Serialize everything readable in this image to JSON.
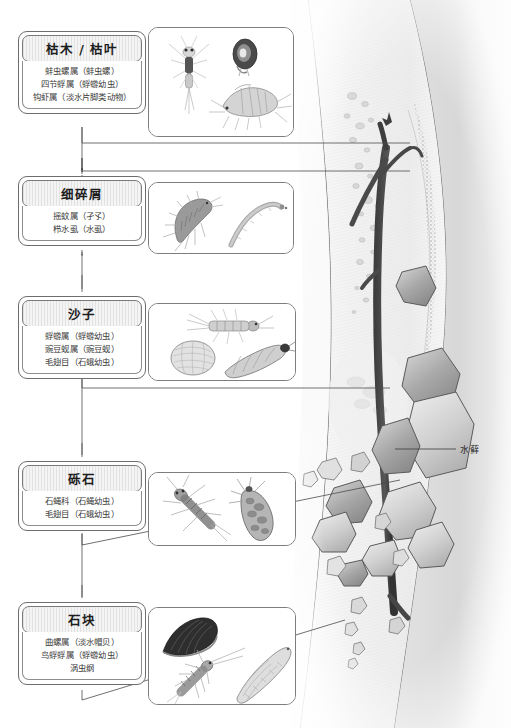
{
  "header": {
    "cropped_text": "有鳞片 底栖动物 — 河流底质分布 示意图"
  },
  "figure": {
    "stream_callout_label": "水藓"
  },
  "cards": [
    {
      "id": "deadwood",
      "title": "枯木 / 枯叶",
      "entries": [
        "蚌虫螺属（蚌虫螺）",
        "四节蜉属（蜉蝣幼虫）",
        "钩虾属（淡水片脚类动物）"
      ]
    },
    {
      "id": "fine-detritus",
      "title": "细碎屑",
      "entries": [
        "摇蚊属（孑孓）",
        "栉水虱（水虱）"
      ]
    },
    {
      "id": "sand",
      "title": "沙子",
      "entries": [
        "蜉蝣属（蜉蝣幼虫）",
        "豌豆蚬属（豌豆蚬）",
        "毛翅目（石蛾幼虫）"
      ]
    },
    {
      "id": "gravel",
      "title": "砾石",
      "entries": [
        "石蝇科（石蝇幼虫）",
        "毛翅目（石蛾幼虫）"
      ]
    },
    {
      "id": "boulder",
      "title": "石块",
      "entries": [
        "曲螺属（淡水帽贝）",
        "鸟蜉蜉属（蜉蝣幼虫）",
        "涡虫纲"
      ]
    }
  ],
  "panels": [
    {
      "id": "panel-deadwood",
      "specimens": [
        "mayfly-nymph-icon",
        "snail-icon",
        "amphipod-icon"
      ]
    },
    {
      "id": "panel-fine-detritus",
      "specimens": [
        "water-louse-icon",
        "midge-larva-icon"
      ]
    },
    {
      "id": "panel-sand",
      "specimens": [
        "mayfly-nymph-icon",
        "pea-clam-icon",
        "caddisfly-case-icon"
      ]
    },
    {
      "id": "panel-gravel",
      "specimens": [
        "stonefly-nymph-icon",
        "caddisfly-case-icon"
      ]
    },
    {
      "id": "panel-boulder",
      "specimens": [
        "limpet-icon",
        "mayfly-nymph-icon",
        "flatworm-icon"
      ]
    }
  ],
  "colors": {
    "ink": "#2a2a2a",
    "card_border": "#6d6d6d",
    "title_hatch": "#e2e2e2",
    "water": "#f3f3f3",
    "bank": "#e8e8e8",
    "branch": "#4a4a4a",
    "rock_dark": "#8d8d8d",
    "rock_light": "#dcdcdc"
  }
}
